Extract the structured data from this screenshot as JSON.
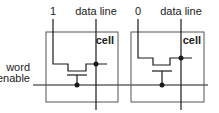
{
  "diagram": {
    "word_line_label_line1": "word",
    "word_line_label_line2": "enable",
    "cells": [
      {
        "bit_label": "1",
        "data_line_label": "data line",
        "cell_label": "cell"
      },
      {
        "bit_label": "0",
        "data_line_label": "data line",
        "cell_label": "cell"
      }
    ],
    "colors": {
      "line": "#1a1a1a",
      "box": "#555555",
      "text": "#222222"
    }
  }
}
